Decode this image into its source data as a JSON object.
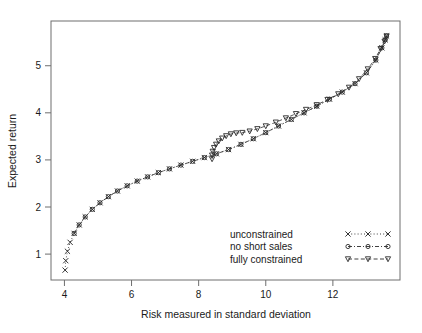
{
  "chart_data": {
    "type": "scatter",
    "title": "",
    "xlabel": "Risk measured in standard deviation",
    "ylabel": "Expected return",
    "xlim": [
      3.6,
      14.0
    ],
    "ylim": [
      0.45,
      5.95
    ],
    "xticks": [
      4,
      6,
      8,
      10,
      12
    ],
    "yticks": [
      1,
      2,
      3,
      4,
      5
    ],
    "grid": false,
    "legend_position": "bottom-right",
    "series": [
      {
        "name": "unconstrained",
        "marker": "x",
        "linestyle": "dotted",
        "color": "#2b2b2b",
        "points": [
          [
            4.02,
            0.66
          ],
          [
            4.04,
            0.86
          ],
          [
            4.09,
            1.06
          ],
          [
            4.17,
            1.25
          ],
          [
            4.29,
            1.44
          ],
          [
            4.44,
            1.62
          ],
          [
            4.62,
            1.79
          ],
          [
            4.83,
            1.95
          ],
          [
            5.06,
            2.09
          ],
          [
            5.31,
            2.22
          ],
          [
            5.58,
            2.34
          ],
          [
            5.87,
            2.45
          ],
          [
            6.17,
            2.55
          ],
          [
            6.48,
            2.64
          ],
          [
            6.8,
            2.73
          ],
          [
            7.13,
            2.81
          ],
          [
            7.47,
            2.89
          ],
          [
            7.82,
            2.97
          ],
          [
            8.17,
            3.05
          ],
          [
            8.53,
            3.13
          ],
          [
            8.89,
            3.22
          ],
          [
            9.26,
            3.33
          ],
          [
            9.63,
            3.45
          ],
          [
            10.0,
            3.58
          ],
          [
            10.38,
            3.72
          ],
          [
            10.76,
            3.86
          ],
          [
            11.14,
            4.0
          ],
          [
            11.52,
            4.14
          ],
          [
            11.9,
            4.29
          ],
          [
            12.28,
            4.44
          ],
          [
            12.66,
            4.62
          ],
          [
            13.0,
            4.85
          ],
          [
            13.28,
            5.12
          ],
          [
            13.46,
            5.38
          ],
          [
            13.56,
            5.55
          ],
          [
            13.6,
            5.63
          ]
        ]
      },
      {
        "name": "no short sales",
        "marker": "circle",
        "linestyle": "dashdot",
        "color": "#2b2b2b",
        "points": [
          [
            4.29,
            1.44
          ],
          [
            4.44,
            1.62
          ],
          [
            4.62,
            1.79
          ],
          [
            4.83,
            1.95
          ],
          [
            5.06,
            2.09
          ],
          [
            5.31,
            2.22
          ],
          [
            5.58,
            2.34
          ],
          [
            5.87,
            2.45
          ],
          [
            6.17,
            2.55
          ],
          [
            6.48,
            2.64
          ],
          [
            6.8,
            2.73
          ],
          [
            7.13,
            2.81
          ],
          [
            7.47,
            2.89
          ],
          [
            7.82,
            2.97
          ],
          [
            8.17,
            3.05
          ],
          [
            8.53,
            3.13
          ],
          [
            8.89,
            3.22
          ],
          [
            9.26,
            3.33
          ],
          [
            9.63,
            3.45
          ],
          [
            10.0,
            3.58
          ],
          [
            10.38,
            3.72
          ],
          [
            10.76,
            3.86
          ],
          [
            11.14,
            4.0
          ],
          [
            11.52,
            4.14
          ],
          [
            11.9,
            4.29
          ],
          [
            12.28,
            4.44
          ],
          [
            12.66,
            4.62
          ],
          [
            13.0,
            4.85
          ],
          [
            13.28,
            5.12
          ],
          [
            13.46,
            5.38
          ],
          [
            13.56,
            5.55
          ],
          [
            13.6,
            5.63
          ]
        ]
      },
      {
        "name": "fully constrained",
        "marker": "triangle-down",
        "linestyle": "dashed",
        "color": "#2b2b2b",
        "points": [
          [
            8.4,
            3.02
          ],
          [
            8.4,
            3.1
          ],
          [
            8.42,
            3.18
          ],
          [
            8.46,
            3.26
          ],
          [
            8.52,
            3.33
          ],
          [
            8.6,
            3.4
          ],
          [
            8.7,
            3.46
          ],
          [
            8.82,
            3.51
          ],
          [
            8.96,
            3.55
          ],
          [
            9.12,
            3.57
          ],
          [
            9.3,
            3.58
          ],
          [
            9.52,
            3.61
          ],
          [
            9.75,
            3.66
          ],
          [
            10.0,
            3.72
          ],
          [
            10.3,
            3.8
          ],
          [
            10.6,
            3.89
          ],
          [
            10.9,
            3.98
          ],
          [
            11.2,
            4.07
          ],
          [
            11.52,
            4.17
          ],
          [
            11.84,
            4.28
          ],
          [
            12.16,
            4.4
          ],
          [
            12.48,
            4.54
          ],
          [
            12.78,
            4.72
          ],
          [
            13.04,
            4.93
          ],
          [
            13.26,
            5.15
          ],
          [
            13.42,
            5.36
          ],
          [
            13.54,
            5.52
          ],
          [
            13.6,
            5.63
          ]
        ]
      }
    ]
  },
  "legend": {
    "entries": [
      {
        "label": "unconstrained"
      },
      {
        "label": "no short sales"
      },
      {
        "label": "fully constrained"
      }
    ]
  }
}
